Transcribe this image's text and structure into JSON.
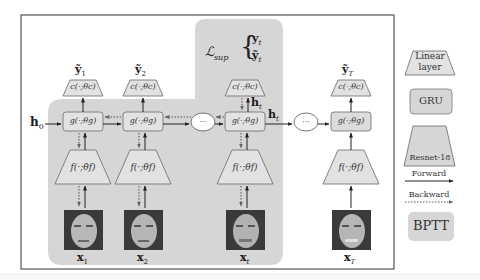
{
  "diagram": {
    "hidden_init": "h",
    "hidden_init_sub": "0",
    "loss": {
      "symbol": "ℒ",
      "sub": "sup",
      "target": "y",
      "target_sub": "t",
      "pred": "ỹ",
      "pred_sub": "t"
    },
    "hidden_labels": [
      {
        "text": "h",
        "sub": "t"
      },
      {
        "text": "h",
        "sub": "t"
      }
    ],
    "ellipsis": "...",
    "columns": [
      {
        "id": "1",
        "pred": "ỹ",
        "pred_sub": "1",
        "classifier": "c(·;θc)",
        "gru": "g(·;θg)",
        "encoder": "f(·;θf)",
        "input": "x",
        "input_sub": "1"
      },
      {
        "id": "2",
        "pred": "ỹ",
        "pred_sub": "2",
        "classifier": "c(·;θc)",
        "gru": "g(·;θg)",
        "encoder": "f(·;θf)",
        "input": "x",
        "input_sub": "2"
      },
      {
        "id": "t",
        "pred": "",
        "pred_sub": "",
        "classifier": "c(·;θc)",
        "gru": "g(·;θg)",
        "encoder": "f(·;θf)",
        "input": "x",
        "input_sub": "t"
      },
      {
        "id": "T",
        "pred": "ỹ",
        "pred_sub": "T",
        "classifier": "c(·;θc)",
        "gru": "g(·;θg)",
        "encoder": "f(·;θf)",
        "input": "x",
        "input_sub": "T"
      }
    ]
  },
  "legend": {
    "linear": {
      "line1": "Linear",
      "line2": "layer"
    },
    "gru": "GRU",
    "resnet": "Resnet-18",
    "forward": "Forward",
    "backward": "Backward",
    "bptt": "BPTT"
  },
  "colors": {
    "frame": "#555555",
    "bptt_fill": "#d6d6d6",
    "box_fill": "#e2e2e2",
    "box_stroke": "#6a6a6a",
    "arrow": "#222222"
  }
}
